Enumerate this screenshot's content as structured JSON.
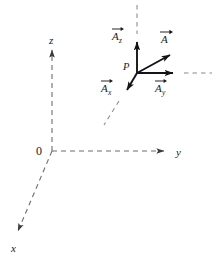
{
  "figure": {
    "background_color": "#ffffff",
    "axis_color": "#6d6d72",
    "vector_color": "#141418",
    "labels": {
      "origin": "0",
      "axis_x": "x",
      "axis_y": "y",
      "axis_z": "z",
      "point_p": "P",
      "vector_a": "A",
      "vector_ax_base": "A",
      "vector_ax_sub": "x",
      "vector_ay_base": "A",
      "vector_ay_sub": "y",
      "vector_az_base": "A",
      "vector_az_sub": "z"
    },
    "geometry": {
      "origin": [
        52,
        151
      ],
      "point_p": [
        137,
        73
      ],
      "y_axis_end": [
        168,
        151
      ],
      "z_axis_end": [
        52,
        46
      ],
      "x_axis_end": [
        14,
        235
      ],
      "vec_a_tip": [
        176,
        51
      ],
      "vec_ay_tip": [
        179,
        73
      ],
      "vec_az_tip": [
        137,
        37
      ],
      "vec_ax_tip": [
        123,
        96
      ]
    }
  }
}
